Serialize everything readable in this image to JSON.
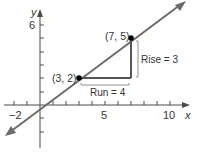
{
  "figure": {
    "type": "slope-diagram",
    "axes": {
      "x_label": "x",
      "y_label": "y",
      "x_tick_labels": [
        "−2",
        "5",
        "10"
      ],
      "y_tick_labels": [
        "6"
      ],
      "x_range": [
        -2,
        10
      ],
      "y_range": [
        -3,
        6
      ]
    },
    "line": {
      "description": "line through (3, 2) and (7, 5)",
      "slope": "3/4"
    },
    "points": [
      {
        "label": "(3, 2)",
        "x": 3,
        "y": 2
      },
      {
        "label": "(7, 5)",
        "x": 7,
        "y": 5
      }
    ],
    "annotations": {
      "run": "Run = 4",
      "rise": "Rise = 3"
    },
    "colors": {
      "line": "#6b6b6b",
      "axis": "#4a4a4a",
      "triangle": "#555555",
      "point": "#000000",
      "text": "#333333"
    }
  }
}
